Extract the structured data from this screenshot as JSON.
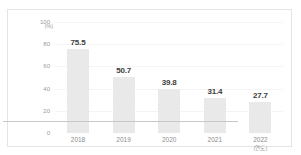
{
  "chart_data": {
    "type": "bar",
    "title": "",
    "xlabel": "(연도)",
    "ylabel": "(%)",
    "categories": [
      "2018",
      "2019",
      "2020",
      "2021",
      "2022"
    ],
    "values": [
      75.5,
      50.7,
      39.8,
      31.4,
      27.7
    ],
    "value_labels": [
      "75.5",
      "50.7",
      "39.8",
      "31.4",
      "27.7"
    ],
    "ylim": [
      0,
      100
    ],
    "yticks": [
      0,
      20,
      40,
      60,
      80,
      100
    ],
    "ytick_labels": [
      "0",
      "20",
      "40",
      "60",
      "80",
      "100"
    ],
    "grid": true,
    "legend": false,
    "bar_color": "#e9e9e9",
    "label_color": "#3d3d3d",
    "axis_color": "#c8c8c8",
    "tick_label_color": "#9a9a9a",
    "grid_color": "#f4f4f4"
  }
}
